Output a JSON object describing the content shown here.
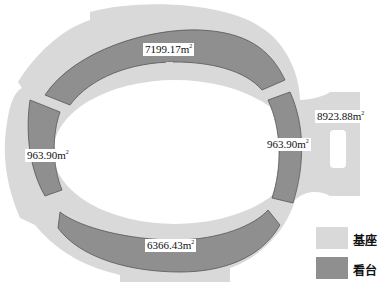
{
  "diagram": {
    "type": "stadium-plan",
    "colors": {
      "base": "#d9d9d9",
      "stand": "#8f8f8f",
      "stand_outline": "#555555",
      "background": "#ffffff"
    },
    "areas": [
      {
        "id": "north-stand",
        "value": "7199.17m",
        "unit_sup": "2"
      },
      {
        "id": "west-stand",
        "value": "963.90m",
        "unit_sup": "2"
      },
      {
        "id": "east-stand",
        "value": "963.90m",
        "unit_sup": "2"
      },
      {
        "id": "south-stand",
        "value": "6366.43m",
        "unit_sup": "2"
      },
      {
        "id": "base-east",
        "value": "8923.88m",
        "unit_sup": "2"
      }
    ]
  },
  "legend": {
    "items": [
      {
        "label": "基座",
        "color": "#d9d9d9"
      },
      {
        "label": "看台",
        "color": "#8f8f8f"
      }
    ]
  }
}
